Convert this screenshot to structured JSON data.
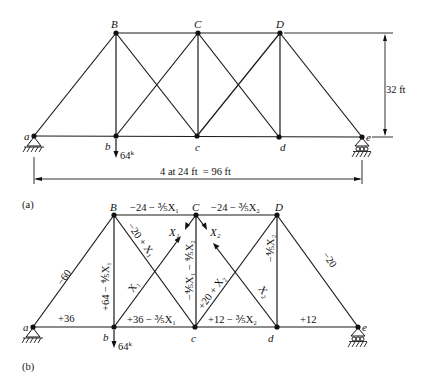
{
  "figure_a": {
    "caption": "(a)",
    "nodes": {
      "a": "a",
      "b": "b",
      "c": "c",
      "d": "d",
      "e": "e",
      "B": "B",
      "C": "C",
      "D": "D"
    },
    "load": "64",
    "load_unit": "k",
    "height_dim": "32 ft",
    "span_dim": "4 at 24 ft  = 96 ft"
  },
  "figure_b": {
    "caption": "(b)",
    "nodes": {
      "a": "a",
      "b": "b",
      "c": "c",
      "d": "d",
      "e": "e",
      "B": "B",
      "C": "C",
      "D": "D"
    },
    "load": "64",
    "load_unit": "k",
    "member_forces": {
      "aB": "−60",
      "ab": "+36",
      "Bb": "+64 − ⅘X₁",
      "BC": "−24 − ⅗X₁",
      "CD": "−24 − ⅗X₂",
      "Bc": "−20 + X₁",
      "bC": "X₁",
      "bc": "+36 − ⅗X₁",
      "Cc": "−⅘X₁ − ⅘X₂",
      "cD": "+20 + X₂",
      "Cd": "X₂",
      "cd": "+12 − ⅗X₂",
      "Dd": "−⅘X₂",
      "De": "−20",
      "de": "+12"
    },
    "redundants": {
      "x1": "X₁",
      "x2": "X₂"
    }
  }
}
